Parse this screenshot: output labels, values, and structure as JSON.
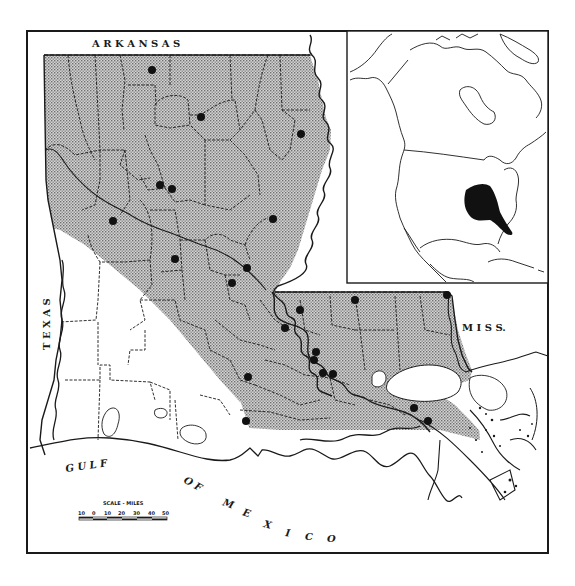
{
  "figure": {
    "type": "range-map",
    "main_map": {
      "region": "Louisiana",
      "labels": {
        "north": "A R K A N S A S",
        "west": "T E X A S",
        "east": "M I S S.",
        "gulf_1": "G U L F",
        "gulf_2": "O F",
        "gulf_3": "M E X I C O"
      },
      "scale": {
        "title": "SCALE - MILES",
        "ticks": [
          "10",
          "0",
          "10",
          "20",
          "30",
          "40",
          "50"
        ]
      },
      "legend": {
        "shaded_area": "species range (stippled)",
        "dots": "locality records"
      },
      "locality_dots_count": 27
    },
    "inset_map": {
      "region": "North America",
      "highlight": "southeastern United States range (solid black)"
    },
    "colors": {
      "background": "#ffffff",
      "ink": "#1a1a1a",
      "stipple": "#b8b8b8"
    }
  }
}
